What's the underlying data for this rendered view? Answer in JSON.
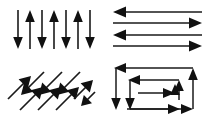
{
  "figure": {
    "background_color": "#ffffff",
    "stroke_color": "#1a1a1a",
    "arrowhead_color": "#111111",
    "panel_count": 4,
    "layout": "2x2 grid"
  },
  "panels": [
    {
      "id": "vertical",
      "name": "Vertical alternating arrows",
      "orientation": "vertical",
      "angle_deg": 90,
      "arrow_count": 7,
      "directions": [
        "down",
        "up",
        "down",
        "up",
        "down",
        "up",
        "down"
      ],
      "arrows": [
        {
          "index": 1,
          "direction": "down",
          "x": 18,
          "y1": 10,
          "y2": 48
        },
        {
          "index": 2,
          "direction": "up",
          "x": 30,
          "y1": 48,
          "y2": 10
        },
        {
          "index": 3,
          "direction": "down",
          "x": 42,
          "y1": 10,
          "y2": 48
        },
        {
          "index": 4,
          "direction": "up",
          "x": 54,
          "y1": 48,
          "y2": 10
        },
        {
          "index": 5,
          "direction": "down",
          "x": 66,
          "y1": 10,
          "y2": 48
        },
        {
          "index": 6,
          "direction": "up",
          "x": 78,
          "y1": 48,
          "y2": 10
        },
        {
          "index": 7,
          "direction": "down",
          "x": 90,
          "y1": 10,
          "y2": 48
        }
      ]
    },
    {
      "id": "horizontal",
      "name": "Horizontal alternating arrows",
      "orientation": "horizontal",
      "angle_deg": 0,
      "arrow_count": 4,
      "directions": [
        "left",
        "right",
        "left",
        "right"
      ],
      "arrows": [
        {
          "index": 1,
          "direction": "left",
          "y": 12,
          "x1": 96,
          "x2": 10
        },
        {
          "index": 2,
          "direction": "right",
          "y": 23,
          "x1": 10,
          "x2": 96
        },
        {
          "index": 3,
          "direction": "left",
          "y": 34,
          "x1": 96,
          "x2": 10
        },
        {
          "index": 4,
          "direction": "right",
          "y": 45,
          "x1": 10,
          "x2": 96
        }
      ]
    },
    {
      "id": "diagonal",
      "name": "Diagonal alternating arrows",
      "orientation": "diagonal",
      "angle_deg": 45,
      "arrow_count": 7,
      "directions": [
        "up-right",
        "down-left",
        "up-right",
        "down-left",
        "up-right",
        "down-left",
        "up-right"
      ],
      "arrows": [
        {
          "index": 1,
          "direction": "up-right",
          "x1": 8,
          "y1": 36,
          "x2": 30,
          "y2": 13
        },
        {
          "index": 2,
          "direction": "down-left",
          "x1": 42,
          "y1": 13,
          "x2": 20,
          "y2": 36
        },
        {
          "index": 3,
          "direction": "up-right",
          "x1": 26,
          "y1": 46,
          "x2": 48,
          "y2": 23
        },
        {
          "index": 4,
          "direction": "down-left",
          "x1": 60,
          "y1": 13,
          "x2": 38,
          "y2": 36
        },
        {
          "index": 5,
          "direction": "up-right",
          "x1": 44,
          "y1": 46,
          "x2": 66,
          "y2": 23
        },
        {
          "index": 6,
          "direction": "down-left",
          "x1": 78,
          "y1": 13,
          "x2": 56,
          "y2": 36
        },
        {
          "index": 7,
          "direction": "up-right",
          "x1": 62,
          "y1": 46,
          "x2": 84,
          "y2": 23
        }
      ]
    },
    {
      "id": "circuit",
      "name": "Nested rectangular circuit arrows",
      "orientation": "rectilinear",
      "shape": "nested rectangles",
      "loop_count": 3,
      "directions": [
        "left",
        "down",
        "left",
        "down",
        "right",
        "up",
        "right",
        "up"
      ],
      "loops": [
        {
          "index": 1,
          "label": "outer loop",
          "left": 10,
          "right": 92,
          "top": 10,
          "bottom": 47,
          "head_top_left": "left",
          "head_bottom_left": "down",
          "head_right": "up",
          "head_bottom_right": "right"
        },
        {
          "index": 2,
          "label": "middle loop",
          "left": 22,
          "right": 80,
          "top": 22,
          "bottom": 40,
          "head_top_left": "left",
          "head_bottom_left": "down",
          "head_right": "up",
          "head_bottom_right": "right"
        },
        {
          "index": 3,
          "label": "inner loop",
          "left": 34,
          "right": 72,
          "top": 31,
          "bottom": 31,
          "head_top_left": "left",
          "head_bottom_left": "down",
          "head_right": "up",
          "head_bottom_right": "right"
        }
      ]
    }
  ]
}
